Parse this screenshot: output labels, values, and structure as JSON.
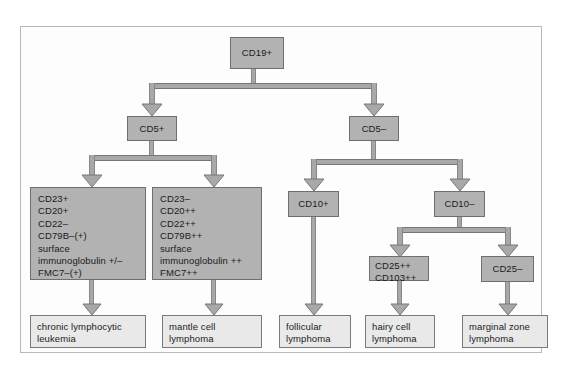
{
  "figure": {
    "colors": {
      "node_fill": "#b2b2b2",
      "leaf_fill": "#e9e9e9",
      "connector": "#a8a8a8",
      "border": "#6f6f6f",
      "frame": "#b9b9b9",
      "text": "#1b1b1b"
    }
  },
  "nodes": {
    "root": {
      "label": "CD19+"
    },
    "cd5_pos": {
      "label": "CD5+"
    },
    "cd5_neg": {
      "label": "CD5–"
    },
    "cd10_pos": {
      "label": "CD10+"
    },
    "cd10_neg": {
      "label": "CD10–"
    },
    "cd25_pos": {
      "lines": [
        "CD25++",
        "CD103++"
      ]
    },
    "cd25_neg": {
      "label": "CD25–"
    }
  },
  "marker_panels": {
    "cll_panel": {
      "lines": [
        "CD23+",
        "CD20+",
        "CD22–",
        "CD79B–(+)",
        "surface",
        "immunoglobulin +/–",
        "FMC7–(+)"
      ]
    },
    "mcl_panel": {
      "lines": [
        "CD23–",
        "CD20++",
        "CD22++",
        "CD79B++",
        "surface",
        "immunoglobulin ++",
        "FMC7++"
      ]
    }
  },
  "diagnoses": {
    "cll": {
      "lines": [
        "chronic lymphocytic",
        "leukemia"
      ]
    },
    "mcl": {
      "lines": [
        "mantle cell",
        "lymphoma"
      ]
    },
    "fl": {
      "lines": [
        "follicular",
        "lymphoma"
      ]
    },
    "hcl": {
      "lines": [
        "hairy cell",
        "lymphoma"
      ]
    },
    "mzl": {
      "lines": [
        "marginal zone",
        "lymphoma"
      ]
    }
  }
}
